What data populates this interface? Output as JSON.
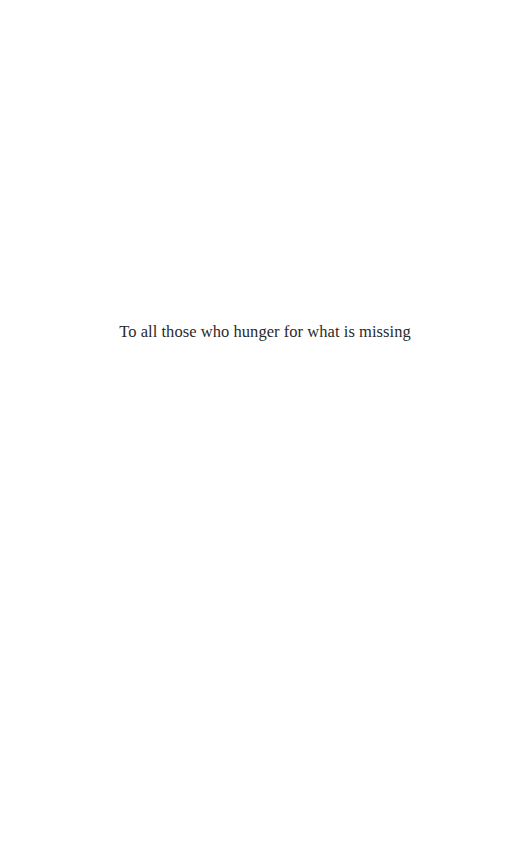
{
  "page": {
    "type": "dedication-page",
    "dedication_text": "To all those who hunger for what is missing"
  }
}
